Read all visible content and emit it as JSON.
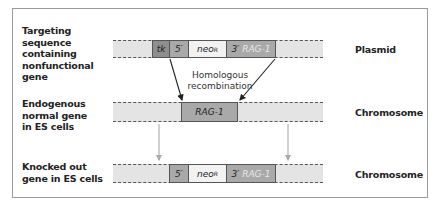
{
  "rows": [
    {
      "left_label": "Targeting\nsequence\ncontaining\nnonfunctional\ngene",
      "right_label": "Plasmid",
      "blocks": {
        "tk": "tk",
        "five_prime": "5′",
        "neo": "neo",
        "neo_sup": "R",
        "three_prime": "3′",
        "rag": "RAG-1"
      }
    },
    {
      "left_label": "Endogenous\nnormal gene\nin ES cells",
      "right_label": "Chromosome",
      "blocks": {
        "rag": "RAG-1"
      }
    },
    {
      "left_label": "Knocked out\ngene in ES cells",
      "right_label": "Chromosome",
      "blocks": {
        "five_prime": "5′",
        "neo": "neo",
        "neo_sup": "R",
        "three_prime": "3′",
        "rag": "RAG-1"
      }
    }
  ],
  "annotation": "Homologous\nrecombination",
  "colors": {
    "frame": "#9a9a9a",
    "bar": "#e4e4e4",
    "tk_block": "#8e8e8e",
    "five_prime_block": "#a9a9a9",
    "neo_block": "#f2f2f2",
    "rag_block": "#a9a9a9",
    "arrow_dark": "#222222",
    "arrow_light": "#aaaaaa"
  }
}
